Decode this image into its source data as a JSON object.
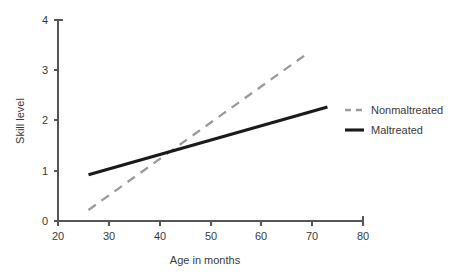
{
  "chart_data": {
    "type": "line",
    "title": "",
    "xlabel": "Age in months",
    "ylabel": "Skill level",
    "xlim": [
      20,
      80
    ],
    "ylim": [
      0,
      4
    ],
    "xticks": [
      20,
      30,
      40,
      50,
      60,
      70,
      80
    ],
    "yticks": [
      0,
      1,
      2,
      3,
      4
    ],
    "xtick_labels": [
      "20",
      "30",
      "40",
      "50",
      "60",
      "70",
      "80"
    ],
    "ytick_labels": [
      "0",
      "1",
      "2",
      "3",
      "4"
    ],
    "grid": false,
    "legend_position": "right",
    "series": [
      {
        "name": "Nonmaltreated",
        "style": "dashed",
        "color": "#9a9a9a",
        "x": [
          26,
          69
        ],
        "values": [
          0.22,
          3.33
        ]
      },
      {
        "name": "Maltreated",
        "style": "solid",
        "color": "#1a1a1a",
        "x": [
          26,
          73
        ],
        "values": [
          0.92,
          2.27
        ]
      }
    ],
    "annotations": []
  },
  "axes": {
    "y_title": "Skill level",
    "x_title": "Age in months"
  },
  "legend": {
    "entries": [
      {
        "label": "Nonmaltreated",
        "style": "dashed",
        "color": "#9a9a9a"
      },
      {
        "label": "Maltreated",
        "style": "solid",
        "color": "#1a1a1a"
      }
    ]
  }
}
